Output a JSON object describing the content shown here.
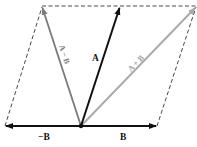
{
  "diagram": {
    "colors": {
      "black_vector": "#111111",
      "gray_vector_diff": "#7a7a7a",
      "gray_vector_sum": "#a8a8a8",
      "dashed": "#333333",
      "background": "#ffffff"
    },
    "origin": {
      "x": 81,
      "y": 126
    },
    "vectors": [
      {
        "id": "B",
        "label": "B",
        "from": [
          81,
          126
        ],
        "to": [
          157,
          126
        ],
        "style": "black"
      },
      {
        "id": "neg-B",
        "label": "−B",
        "from": [
          81,
          126
        ],
        "to": [
          5,
          126
        ],
        "style": "black"
      },
      {
        "id": "A",
        "label": "A",
        "from": [
          81,
          126
        ],
        "to": [
          120,
          7
        ],
        "style": "black"
      },
      {
        "id": "A-minus-B",
        "label": "A − B",
        "from": [
          81,
          126
        ],
        "to": [
          42,
          7
        ],
        "style": "gray"
      },
      {
        "id": "A-plus-B",
        "label": "A + B",
        "from": [
          81,
          126
        ],
        "to": [
          196,
          7
        ],
        "style": "lightgray"
      }
    ],
    "dashed_lines": [
      {
        "from": [
          42,
          6
        ],
        "to": [
          196,
          6
        ]
      },
      {
        "from": [
          5,
          126
        ],
        "to": [
          42,
          7
        ]
      },
      {
        "from": [
          157,
          126
        ],
        "to": [
          196,
          7
        ]
      }
    ],
    "labels": {
      "neg_b": "−B",
      "b": "B",
      "a": "A",
      "a_minus_b": "A − B",
      "a_plus_b": "A + B"
    }
  }
}
